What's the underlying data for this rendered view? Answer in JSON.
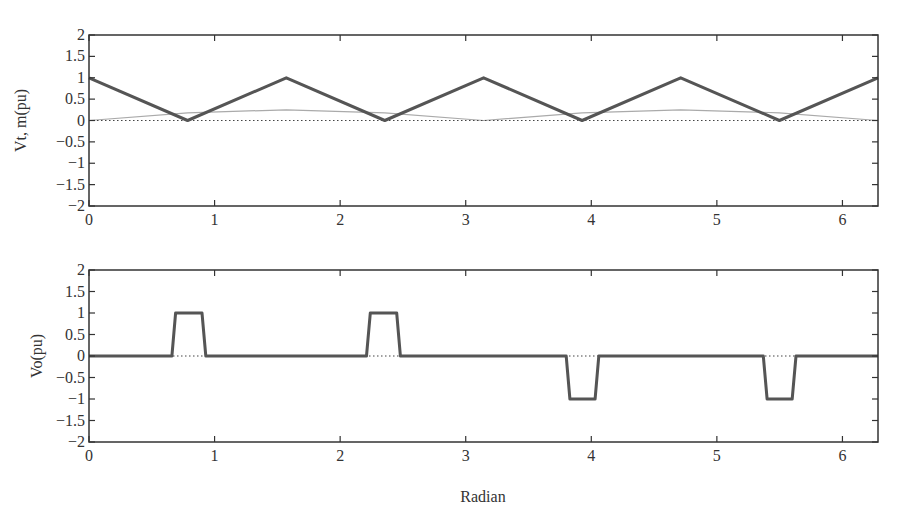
{
  "figure": {
    "xlabel": "Radian"
  },
  "chart_data": [
    {
      "type": "line",
      "title": "",
      "xlabel": "",
      "ylabel": "Vt, m(pu)",
      "xlim": [
        0,
        6.2832
      ],
      "ylim": [
        -2,
        2
      ],
      "xticks": [
        0,
        1,
        2,
        3,
        4,
        5,
        6
      ],
      "yticks": [
        -2,
        -1.5,
        -1,
        -0.5,
        0,
        0.5,
        1,
        1.5,
        2
      ],
      "ytick_labels": [
        "-2",
        "-1.5",
        "-1",
        "-0.5",
        "0",
        "0.5",
        "1",
        "1.5",
        "2"
      ],
      "grid": false,
      "legend": null,
      "series": [
        {
          "name": "Vt (triangular carrier)",
          "style": "solid-thick",
          "color": "#555555",
          "x": [
            0,
            0.785,
            1.571,
            2.356,
            3.142,
            3.927,
            4.712,
            5.498,
            6.283
          ],
          "y": [
            1,
            0,
            1,
            0,
            1,
            0,
            1,
            0,
            1
          ]
        },
        {
          "name": "m (reference)",
          "style": "solid-thin",
          "color": "#aaaaaa",
          "x": [
            0,
            0.785,
            1.571,
            2.356,
            3.142,
            3.927,
            4.712,
            5.498,
            6.283
          ],
          "y": [
            0,
            0.18,
            0.25,
            0.18,
            0,
            0.18,
            0.25,
            0.18,
            0
          ]
        },
        {
          "name": "zero line",
          "style": "dotted",
          "color": "#444444",
          "x": [
            0,
            6.283
          ],
          "y": [
            0,
            0
          ]
        }
      ]
    },
    {
      "type": "line",
      "title": "",
      "xlabel": "Radian",
      "ylabel": "Vo(pu)",
      "xlim": [
        0,
        6.2832
      ],
      "ylim": [
        -2,
        2
      ],
      "xticks": [
        0,
        1,
        2,
        3,
        4,
        5,
        6
      ],
      "yticks": [
        -2,
        -1.5,
        -1,
        -0.5,
        0,
        0.5,
        1,
        1.5,
        2
      ],
      "ytick_labels": [
        "-2",
        "-1.5",
        "-1",
        "-0.5",
        "0",
        "0.5",
        "1",
        "1.5",
        "2"
      ],
      "grid": false,
      "legend": null,
      "series": [
        {
          "name": "Vo (output pulses)",
          "style": "solid-thick",
          "color": "#555555",
          "x": [
            0,
            0.66,
            0.69,
            0.9,
            0.93,
            2.21,
            2.24,
            2.45,
            2.48,
            3.8,
            3.83,
            4.03,
            4.06,
            5.37,
            5.4,
            5.6,
            5.63,
            6.283
          ],
          "y": [
            0,
            0,
            1,
            1,
            0,
            0,
            1,
            1,
            0,
            0,
            -1,
            -1,
            0,
            0,
            -1,
            -1,
            0,
            0
          ]
        },
        {
          "name": "zero line",
          "style": "dotted",
          "color": "#444444",
          "x": [
            0,
            6.283
          ],
          "y": [
            0,
            0
          ]
        }
      ]
    }
  ]
}
